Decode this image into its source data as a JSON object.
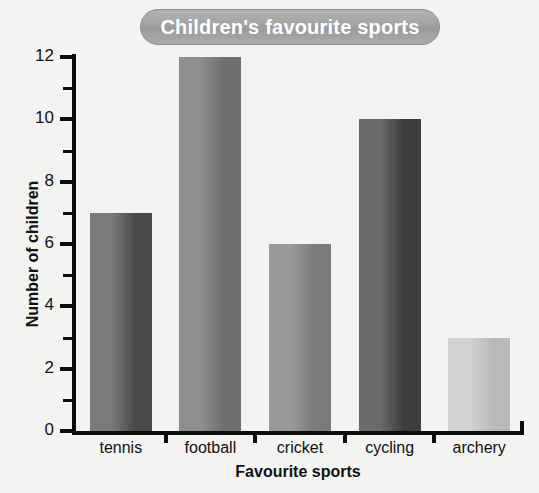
{
  "chart_data": {
    "type": "bar",
    "title": "Children's favourite sports",
    "xlabel": "Favourite sports",
    "ylabel": "Number of children",
    "categories": [
      "tennis",
      "football",
      "cricket",
      "cycling",
      "archery"
    ],
    "values": [
      7,
      12,
      6,
      10,
      3
    ],
    "ylim": [
      0,
      12
    ],
    "y_major_ticks": [
      "0",
      "2",
      "4",
      "6",
      "8",
      "10",
      "12"
    ],
    "y_major_tick_values": [
      0,
      2,
      4,
      6,
      8,
      10,
      12
    ],
    "y_minor_tick_values": [
      1,
      3,
      5,
      7,
      9,
      11
    ],
    "grid": false,
    "legend": "none",
    "bar_colors": [
      "#7a7a7a",
      "#8e8e8e",
      "#9a9a9a",
      "#6a6a6a",
      "#d2d2d2"
    ],
    "bar_colors_dark": [
      "#4a4a4a",
      "#6f6f6f",
      "#7b7b7b",
      "#3d3d3d",
      "#b9b9b9"
    ],
    "background_color": "#f3f3f1",
    "title_banner_color": "#a2a2a2",
    "title_text_color": "#ffffff",
    "axis_color": "#0d0d0d"
  }
}
